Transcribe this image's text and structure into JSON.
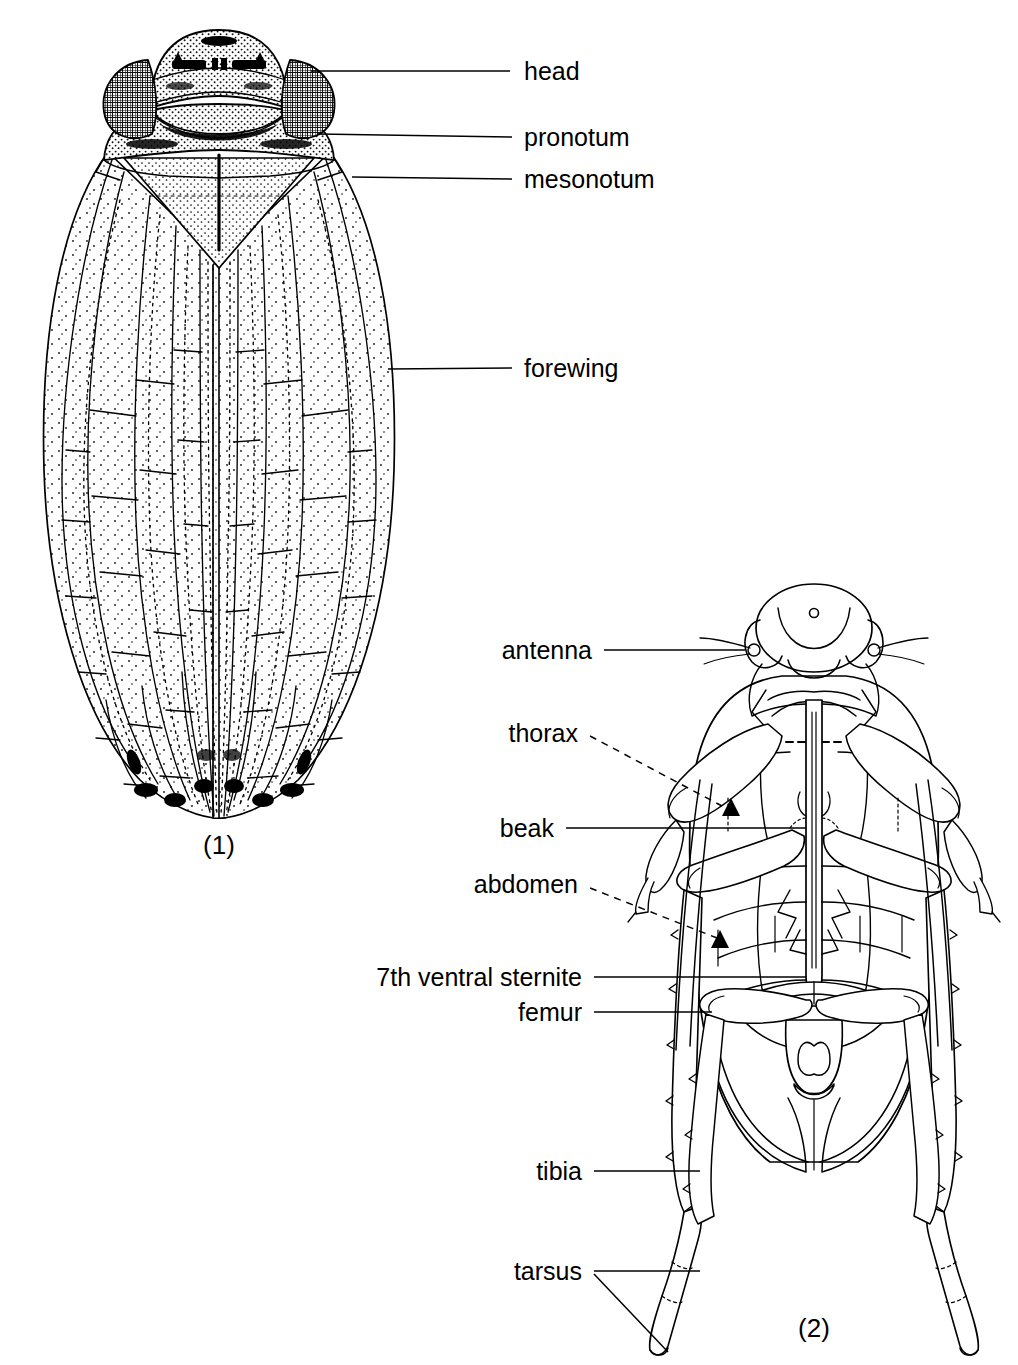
{
  "plate": {
    "background_color": "#ffffff",
    "ink_color": "#000000",
    "subject": "leafhopper-anatomy-plate",
    "figures": [
      {
        "number": "(1)",
        "view": "dorsal",
        "number_x": 219,
        "number_y": 845
      },
      {
        "number": "(2)",
        "view": "ventral",
        "number_x": 814,
        "number_y": 1328
      }
    ]
  },
  "labels": [
    {
      "id": "head",
      "text": "head",
      "text_x": 524,
      "text_y": 71,
      "anchor": "start",
      "leader": {
        "type": "solid",
        "x1": 510,
        "y1": 71,
        "x2": 311,
        "y2": 71
      }
    },
    {
      "id": "pronotum",
      "text": "pronotum",
      "text_x": 524,
      "text_y": 137,
      "anchor": "start",
      "leader": {
        "type": "solid",
        "x1": 512,
        "y1": 137,
        "x2": 318,
        "y2": 134
      }
    },
    {
      "id": "mesonotum",
      "text": "mesonotum",
      "text_x": 524,
      "text_y": 179,
      "anchor": "start",
      "leader": {
        "type": "solid",
        "x1": 512,
        "y1": 179,
        "x2": 352,
        "y2": 177
      }
    },
    {
      "id": "forewing",
      "text": "forewing",
      "text_x": 524,
      "text_y": 368,
      "anchor": "start",
      "leader": {
        "type": "solid",
        "x1": 512,
        "y1": 368,
        "x2": 388,
        "y2": 369
      }
    },
    {
      "id": "antenna",
      "text": "antenna",
      "text_x": 592,
      "text_y": 650,
      "anchor": "end",
      "leader": {
        "type": "solid",
        "x1": 604,
        "y1": 650,
        "x2": 745,
        "y2": 650
      }
    },
    {
      "id": "thorax",
      "text": "thorax",
      "text_x": 578,
      "text_y": 733,
      "anchor": "end",
      "leader": {
        "type": "dashed",
        "x1": 590,
        "y1": 736,
        "x2": 722,
        "y2": 806
      }
    },
    {
      "id": "beak",
      "text": "beak",
      "text_x": 554,
      "text_y": 828,
      "anchor": "end",
      "leader": {
        "type": "solid",
        "x1": 566,
        "y1": 828,
        "x2": 806,
        "y2": 828
      }
    },
    {
      "id": "abdomen",
      "text": "abdomen",
      "text_x": 578,
      "text_y": 884,
      "anchor": "end",
      "leader": {
        "type": "dashed",
        "x1": 590,
        "y1": 888,
        "x2": 717,
        "y2": 938
      }
    },
    {
      "id": "7th-ventral-sternite",
      "text": "7th ventral sternite",
      "text_x": 582,
      "text_y": 977,
      "anchor": "end",
      "leader": {
        "type": "solid",
        "x1": 594,
        "y1": 977,
        "x2": 806,
        "y2": 977
      }
    },
    {
      "id": "femur",
      "text": "femur",
      "text_x": 582,
      "text_y": 1012,
      "anchor": "end",
      "leader": {
        "type": "solid",
        "x1": 594,
        "y1": 1012,
        "x2": 712,
        "y2": 1012
      }
    },
    {
      "id": "tibia",
      "text": "tibia",
      "text_x": 582,
      "text_y": 1171,
      "anchor": "end",
      "leader": {
        "type": "solid",
        "x1": 594,
        "y1": 1171,
        "x2": 700,
        "y2": 1171
      }
    },
    {
      "id": "tarsus",
      "text": "tarsus",
      "text_x": 582,
      "text_y": 1271,
      "anchor": "end",
      "leader": {
        "type": "solid",
        "x1": 594,
        "y1": 1271,
        "x2": 700,
        "y2": 1271
      },
      "leader2": {
        "type": "solid",
        "x1": 594,
        "y1": 1274,
        "x2": 668,
        "y2": 1352
      }
    }
  ]
}
